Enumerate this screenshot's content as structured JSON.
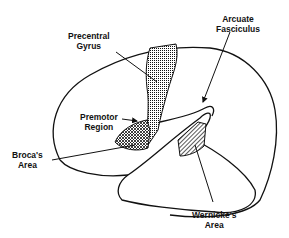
{
  "diagram": {
    "colors": {
      "stroke": "#111111",
      "background": "#ffffff"
    },
    "labels": {
      "precentral_gyrus": {
        "line1": "Precentral",
        "line2": "Gyrus"
      },
      "arcuate_fasciculus": {
        "line1": "Arcuate",
        "line2": "Fasciculus"
      },
      "premotor_region": {
        "line1": "Premotor",
        "line2": "Region"
      },
      "brocas_area": {
        "line1": "Broca's",
        "line2": "Area"
      },
      "wernickes_area": {
        "line1": "Wernicke's",
        "line2": "Area"
      }
    }
  }
}
